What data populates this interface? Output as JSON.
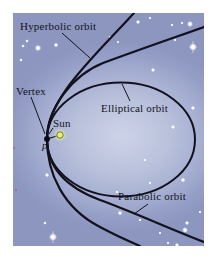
{
  "diagram": {
    "labels": {
      "hyperbolic_orbit": "Hyperbolic orbit",
      "vertex": "Vertex",
      "sun": "Sun",
      "p": "p",
      "elliptical_orbit": "Elliptical orbit",
      "parabolic_orbit": "Parabolic orbit"
    },
    "colors": {
      "background_center": "#cdd3e8",
      "background_edge": "#8c96bf",
      "curve": "#12121c",
      "text": "#14141c",
      "sun_core": "#e9f06d",
      "sun_ring": "#7c7c2e",
      "star": "#ffffff",
      "frame": "#ffffff"
    },
    "stars": [
      {
        "x": 25,
        "y": 35,
        "r": 1.8,
        "cross": false
      },
      {
        "x": 10,
        "y": 33,
        "r": 1.0,
        "cross": false
      },
      {
        "x": 43,
        "y": 32,
        "r": 1.3,
        "cross": false
      },
      {
        "x": 8,
        "y": 47,
        "r": 1.0,
        "cross": false
      },
      {
        "x": 14,
        "y": 28,
        "r": 1.0,
        "cross": false
      },
      {
        "x": 97,
        "y": 24,
        "r": 0.8,
        "cross": false
      },
      {
        "x": 125,
        "y": 9,
        "r": 1.2,
        "cross": false
      },
      {
        "x": 137,
        "y": 5,
        "r": 0.9,
        "cross": false
      },
      {
        "x": 159,
        "y": 12,
        "r": 0.9,
        "cross": false
      },
      {
        "x": 169,
        "y": 10,
        "r": 0.9,
        "cross": false
      },
      {
        "x": 177,
        "y": 11,
        "r": 1.7,
        "cross": false
      },
      {
        "x": 180,
        "y": 34,
        "r": 2.2,
        "cross": true
      },
      {
        "x": 140,
        "y": 57,
        "r": 1.2,
        "cross": false
      },
      {
        "x": 105,
        "y": 29,
        "r": 0.8,
        "cross": false
      },
      {
        "x": 162,
        "y": 27,
        "r": 0.9,
        "cross": false
      },
      {
        "x": 180,
        "y": 95,
        "r": 1.2,
        "cross": false
      },
      {
        "x": 160,
        "y": 114,
        "r": 1.2,
        "cross": false
      },
      {
        "x": 170,
        "y": 167,
        "r": 1.3,
        "cross": false
      },
      {
        "x": 34,
        "y": 162,
        "r": 1.2,
        "cross": false
      },
      {
        "x": 40,
        "y": 224,
        "r": 2.2,
        "cross": true
      },
      {
        "x": 32,
        "y": 210,
        "r": 1.0,
        "cross": false
      },
      {
        "x": 107,
        "y": 200,
        "r": 1.3,
        "cross": false
      },
      {
        "x": 104,
        "y": 179,
        "r": 0.9,
        "cross": false
      },
      {
        "x": 174,
        "y": 210,
        "r": 1.2,
        "cross": false
      },
      {
        "x": 172,
        "y": 217,
        "r": 1.6,
        "cross": false
      },
      {
        "x": 147,
        "y": 220,
        "r": 0.9,
        "cross": false
      },
      {
        "x": 164,
        "y": 232,
        "r": 1.2,
        "cross": false
      },
      {
        "x": 155,
        "y": 230,
        "r": 0.9,
        "cross": false
      },
      {
        "x": 127,
        "y": 207,
        "r": 0.9,
        "cross": false
      },
      {
        "x": 187,
        "y": 199,
        "r": 0.9,
        "cross": false
      },
      {
        "x": 137,
        "y": 170,
        "r": 0.9,
        "cross": false
      },
      {
        "x": 132,
        "y": 147,
        "r": 0.8,
        "cross": false
      }
    ],
    "red_specks": [
      {
        "x": 1,
        "y": 135,
        "r": 1.0
      },
      {
        "x": 3,
        "y": 177,
        "r": 0.9
      }
    ]
  }
}
